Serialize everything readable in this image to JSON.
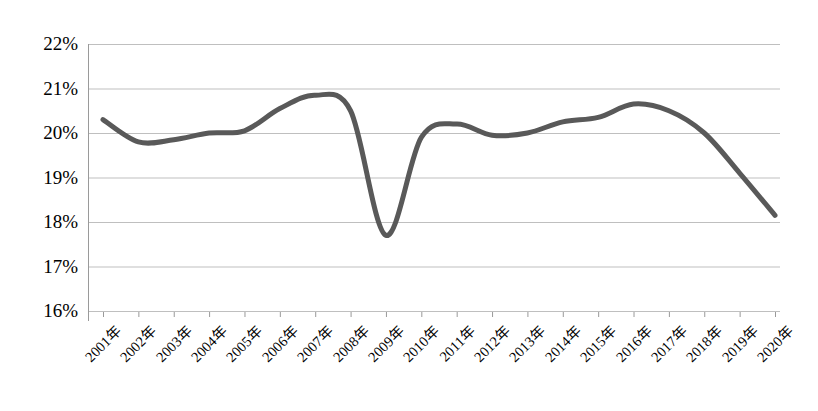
{
  "chart_data": {
    "type": "line",
    "title": "",
    "subtitle": "",
    "xlabel": "",
    "ylabel": "",
    "categories": [
      "2001年",
      "2002年",
      "2003年",
      "2004年",
      "2005年",
      "2006年",
      "2007年",
      "2008年",
      "2009年",
      "2010年",
      "2011年",
      "2012年",
      "2013年",
      "2014年",
      "2015年",
      "2016年",
      "2017年",
      "2018年",
      "2019年",
      "2020年"
    ],
    "values": [
      20.3,
      19.8,
      19.85,
      20.0,
      20.05,
      20.55,
      20.85,
      20.5,
      17.7,
      19.9,
      20.2,
      19.95,
      20.0,
      20.25,
      20.35,
      20.65,
      20.5,
      20.0,
      19.1,
      18.15
    ],
    "series": [
      {
        "name": "",
        "values": [
          20.3,
          19.8,
          19.85,
          20.0,
          20.05,
          20.55,
          20.85,
          20.5,
          17.7,
          19.9,
          20.2,
          19.95,
          20.0,
          20.25,
          20.35,
          20.65,
          20.5,
          20.0,
          19.1,
          18.15
        ]
      }
    ],
    "ylim": [
      16,
      22
    ],
    "ytick_values": [
      16,
      17,
      18,
      19,
      20,
      21,
      22
    ],
    "ytick_labels": [
      "16%",
      "17%",
      "18%",
      "19%",
      "20%",
      "21%",
      "22%"
    ],
    "yunit": "%",
    "grid": true,
    "grid_axis": "y",
    "legend": false,
    "legend_position": "none",
    "markers": false,
    "smooth": true,
    "line_color": "#595959",
    "line_width": 5,
    "grid_color": "#bfbfbf",
    "axis_color": "#9a9a9a",
    "background": "#ffffff",
    "annotations": []
  }
}
